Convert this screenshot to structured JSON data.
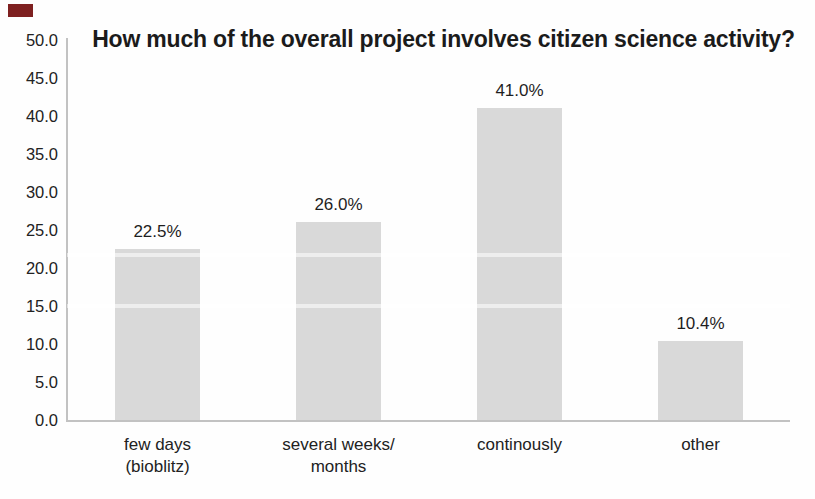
{
  "figure": {
    "background_color": "#fefefe",
    "artifact_mark_color": "#7e2020"
  },
  "chart_data": {
    "type": "bar",
    "title": "How much of the overall project involves citizen science activity?",
    "categories": [
      "few days (bioblitz)",
      "several weeks/ months",
      "continously",
      "other"
    ],
    "category_lines": [
      [
        "few days",
        "(bioblitz)"
      ],
      [
        "several weeks/",
        "months"
      ],
      [
        "continously"
      ],
      [
        "other"
      ]
    ],
    "values": [
      22.5,
      26.0,
      41.0,
      10.4
    ],
    "value_labels": [
      "22.5%",
      "26.0%",
      "41.0%",
      "10.4%"
    ],
    "xlabel": "",
    "ylabel": "",
    "ylim": [
      0,
      50
    ],
    "y_tick_values": [
      50,
      45,
      40,
      35,
      30,
      25,
      20,
      15,
      10,
      5,
      0
    ],
    "y_tick_labels": [
      "50.0",
      "45.0",
      "40.0",
      "35.0",
      "30.0",
      "25.0",
      "20.0",
      "15.0",
      "10.0",
      "5.0",
      "0.0"
    ],
    "grid": false,
    "legend": false,
    "bar_color": "#d9d9d9",
    "axis_color": "#c2c2c2",
    "text_color": "#1c1c1c"
  }
}
